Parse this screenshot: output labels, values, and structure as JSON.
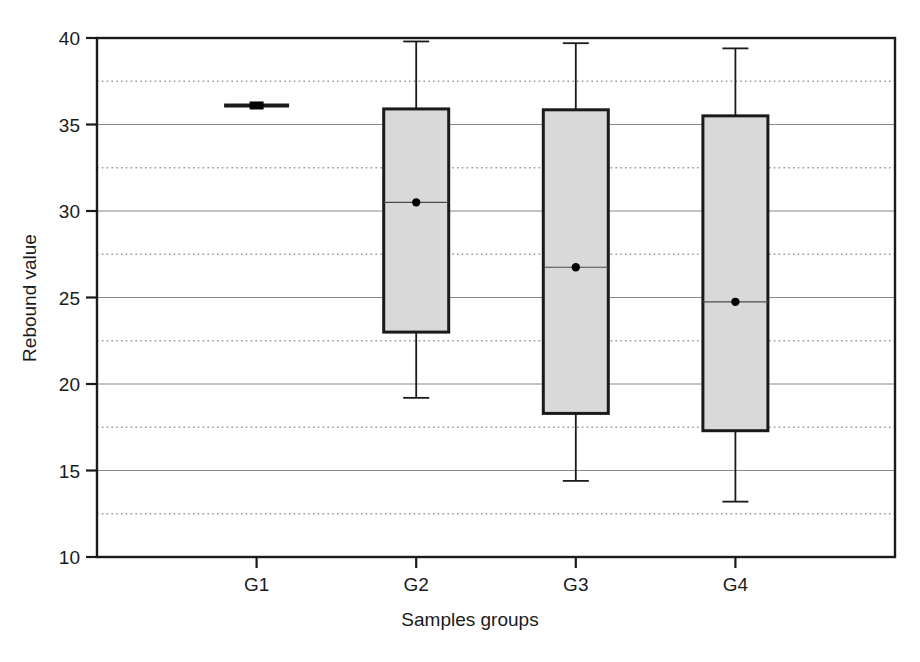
{
  "chart_data": {
    "type": "box",
    "title": "",
    "xlabel": "Samples groups",
    "ylabel": "Rebound value",
    "categories": [
      "G1",
      "G2",
      "G3",
      "G4"
    ],
    "ylim": [
      10,
      40
    ],
    "yticks": [
      10,
      15,
      20,
      25,
      30,
      35,
      40
    ],
    "ytick_labels": [
      "10",
      "15",
      "20",
      "25",
      "30",
      "35",
      "40"
    ],
    "minor_gridlines": [
      12.5,
      17.5,
      22.5,
      27.5,
      32.5,
      37.5
    ],
    "grid": "major-solid-minor-dotted",
    "legend": "none",
    "boxes": [
      {
        "category": "G1",
        "whisker_low": 36.1,
        "q1": 36.1,
        "median": 36.1,
        "q3": 36.1,
        "whisker_high": 36.1,
        "degenerate": true
      },
      {
        "category": "G2",
        "whisker_low": 19.2,
        "q1": 23.0,
        "median": 30.5,
        "q3": 35.9,
        "whisker_high": 39.8,
        "degenerate": false
      },
      {
        "category": "G3",
        "whisker_low": 14.4,
        "q1": 18.3,
        "median": 26.75,
        "q3": 35.85,
        "whisker_high": 39.7,
        "degenerate": false
      },
      {
        "category": "G4",
        "whisker_low": 13.2,
        "q1": 17.3,
        "median": 24.75,
        "q3": 35.5,
        "whisker_high": 39.4,
        "degenerate": false
      }
    ],
    "colors": {
      "box_fill": "#d9d9d9",
      "box_stroke": "#1a1a1a",
      "whisker": "#1a1a1a",
      "median_marker": "#000000",
      "major_grid": "#8a8a8a",
      "minor_grid": "#9a9a9a",
      "frame": "#1a1a1a",
      "text": "#1a1a1a"
    }
  }
}
